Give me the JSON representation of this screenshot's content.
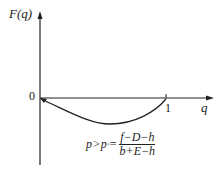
{
  "diagram": {
    "y_label": "F(q)",
    "x_label": "q",
    "origin_label": "0",
    "x_tick_label": "1",
    "formula": {
      "lhs": "p",
      "op1": ">",
      "p_sym": "p",
      "sub": "*",
      "op2": "=",
      "numerator": "f−D−h",
      "denominator": "b+E−h"
    }
  }
}
